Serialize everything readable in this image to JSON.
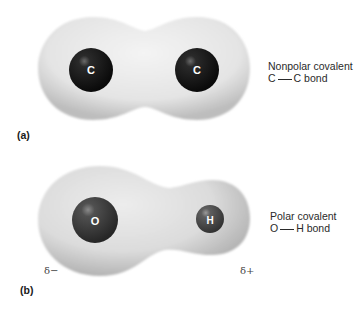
{
  "panels": [
    {
      "id": "a",
      "panel_label": "(a)",
      "bond_type": "Nonpolar covalent",
      "bond_left_atom": "C",
      "bond_right_atom": "C",
      "bond_suffix": "bond",
      "atoms": [
        {
          "symbol": "C",
          "color": "#141414"
        },
        {
          "symbol": "C",
          "color": "#141414"
        }
      ]
    },
    {
      "id": "b",
      "panel_label": "(b)",
      "bond_type": "Polar covalent",
      "bond_left_atom": "O",
      "bond_right_atom": "H",
      "bond_suffix": "bond",
      "atoms": [
        {
          "symbol": "O",
          "color": "#3a3a3a"
        },
        {
          "symbol": "H",
          "color": "#4a4a4a"
        }
      ],
      "partial_charges": {
        "left": "δ−",
        "right": "δ+"
      }
    }
  ],
  "colors": {
    "electron_cloud_light": "#f2f2f2",
    "electron_cloud_dark": "#c8c8c8",
    "text": "#2a2a2a"
  }
}
